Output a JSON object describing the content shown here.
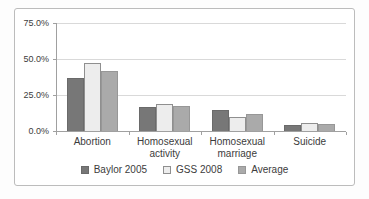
{
  "chart_data": {
    "type": "bar",
    "title": "",
    "xlabel": "",
    "ylabel": "",
    "categories": [
      "Abortion",
      "Homosexual\nactivity",
      "Homosexual\nmarriage",
      "Suicide"
    ],
    "series": [
      {
        "name": "Baylor 2005",
        "color": "#777777",
        "border_color": "#6a6a6a",
        "values": [
          37,
          16.5,
          14.5,
          4.5
        ]
      },
      {
        "name": "GSS 2008",
        "color": "#ededed",
        "border_color": "#8f8f8f",
        "values": [
          47,
          18.5,
          9.5,
          5.5
        ]
      },
      {
        "name": "Average",
        "color": "#aaaaaa",
        "border_color": "#979797",
        "values": [
          42,
          17.5,
          12,
          5
        ]
      }
    ],
    "y_axis": {
      "ticks": [
        {
          "label": "0.0%",
          "value": 0
        },
        {
          "label": "25.0%",
          "value": 25
        },
        {
          "label": "50.0%",
          "value": 50
        },
        {
          "label": "75.0%",
          "value": 75
        }
      ],
      "min": 0,
      "max": 75
    },
    "grid": true,
    "legend_position": "bottom"
  },
  "colors": {
    "frame_border": "#bcbcbc",
    "gridline": "#d9d9d9",
    "axis": "#a0a0a0",
    "text": "#3c3c3c",
    "background": "#ffffff"
  }
}
